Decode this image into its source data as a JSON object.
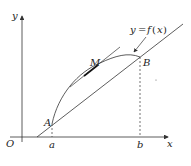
{
  "diagram": {
    "axes": {
      "x_label": "x",
      "y_label": "y",
      "origin_label": "O"
    },
    "ticks": {
      "a": "a",
      "b": "b"
    },
    "points": {
      "A": "A",
      "B": "B",
      "M": "M"
    },
    "curve_label": {
      "y": "y",
      "eq": "=",
      "f": "f",
      "open": "(",
      "x": "x",
      "close": ")"
    },
    "colors": {
      "stroke": "#333333",
      "background": "#ffffff"
    }
  }
}
